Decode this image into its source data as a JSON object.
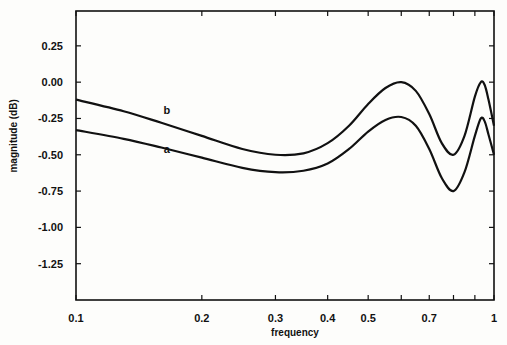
{
  "chart_data": {
    "type": "line",
    "title": "",
    "xlabel": "frequency",
    "ylabel": "magnitude    (dB)",
    "xscale": "log",
    "xlim": [
      0.1,
      1.0
    ],
    "ylim": [
      -1.5,
      0.49
    ],
    "grid": false,
    "x_ticks": [
      {
        "v": 0.1,
        "label": "0.1"
      },
      {
        "v": 0.2,
        "label": "0.2"
      },
      {
        "v": 0.3,
        "label": "0.3"
      },
      {
        "v": 0.4,
        "label": "0.4"
      },
      {
        "v": 0.5,
        "label": "0.5"
      },
      {
        "v": 0.6,
        "label": ""
      },
      {
        "v": 0.7,
        "label": "0.7"
      },
      {
        "v": 0.8,
        "label": ""
      },
      {
        "v": 0.9,
        "label": ""
      },
      {
        "v": 1.0,
        "label": "1"
      }
    ],
    "y_ticks": [
      {
        "v": 0.25,
        "label": "0.25"
      },
      {
        "v": 0.0,
        "label": "0.00"
      },
      {
        "v": -0.25,
        "label": "-0.25"
      },
      {
        "v": -0.5,
        "label": "-0.50"
      },
      {
        "v": -0.75,
        "label": "-0.75"
      },
      {
        "v": -1.0,
        "label": "-1.00"
      },
      {
        "v": -1.25,
        "label": "-1.25"
      }
    ],
    "series": [
      {
        "name": "b",
        "label_at": [
          0.165,
          -0.22
        ],
        "x": [
          0.1,
          0.13,
          0.16,
          0.2,
          0.25,
          0.3,
          0.35,
          0.4,
          0.45,
          0.5,
          0.55,
          0.6,
          0.65,
          0.7,
          0.75,
          0.8,
          0.85,
          0.9,
          0.93,
          0.95,
          0.97,
          1.0
        ],
        "y": [
          -0.12,
          -0.2,
          -0.28,
          -0.37,
          -0.46,
          -0.5,
          -0.49,
          -0.42,
          -0.3,
          -0.15,
          -0.04,
          0.0,
          -0.06,
          -0.22,
          -0.42,
          -0.5,
          -0.37,
          -0.1,
          0.0,
          -0.02,
          -0.12,
          -0.3
        ]
      },
      {
        "name": "a",
        "label_at": [
          0.165,
          -0.49
        ],
        "x": [
          0.1,
          0.13,
          0.16,
          0.2,
          0.25,
          0.3,
          0.35,
          0.4,
          0.45,
          0.5,
          0.55,
          0.6,
          0.65,
          0.7,
          0.75,
          0.8,
          0.85,
          0.9,
          0.93,
          0.95,
          0.97,
          1.0
        ],
        "y": [
          -0.33,
          -0.39,
          -0.45,
          -0.52,
          -0.59,
          -0.62,
          -0.61,
          -0.56,
          -0.46,
          -0.34,
          -0.26,
          -0.24,
          -0.3,
          -0.46,
          -0.66,
          -0.75,
          -0.62,
          -0.37,
          -0.25,
          -0.27,
          -0.36,
          -0.5
        ]
      }
    ]
  }
}
